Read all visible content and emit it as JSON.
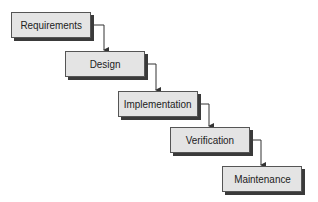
{
  "diagram": {
    "type": "waterfall",
    "stages": [
      {
        "label": "Requirements"
      },
      {
        "label": "Design"
      },
      {
        "label": "Implementation"
      },
      {
        "label": "Verification"
      },
      {
        "label": "Maintenance"
      }
    ],
    "colors": {
      "box_fill": "#e4e4e4",
      "box_border": "#555555",
      "shadow": "#3a3a3a",
      "connector": "#333333"
    }
  }
}
